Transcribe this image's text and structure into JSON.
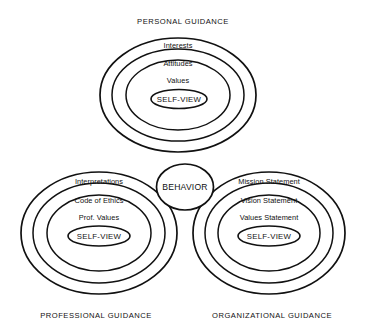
{
  "diagram": {
    "title_top": "PERSONAL GUIDANCE",
    "caption_left": "PROFESSIONAL  GUIDANCE",
    "caption_right": "ORGANIZATIONAL GUIDANCE",
    "center": {
      "label": "BEHAVIOR"
    },
    "colors": {
      "background": "#ffffff",
      "stroke": "#111111",
      "text": "#111111"
    },
    "groups": [
      {
        "id": "personal",
        "caption": "PERSONAL GUIDANCE",
        "caption_position": "top",
        "rings": [
          {
            "label": "Interests"
          },
          {
            "label": "Attitudes"
          },
          {
            "label": "Values"
          },
          {
            "label": "SELF-VIEW"
          }
        ]
      },
      {
        "id": "professional",
        "caption": "PROFESSIONAL  GUIDANCE",
        "caption_position": "bottom",
        "rings": [
          {
            "label": "Interpretations"
          },
          {
            "label": "Code of Ethics"
          },
          {
            "label": "Prof. Values"
          },
          {
            "label": "SELF-VIEW"
          }
        ]
      },
      {
        "id": "organizational",
        "caption": "ORGANIZATIONAL GUIDANCE",
        "caption_position": "bottom",
        "rings": [
          {
            "label": "Mission Statement"
          },
          {
            "label": "Vision Statement"
          },
          {
            "label": "Values Statement"
          },
          {
            "label": "SELF-VIEW"
          }
        ]
      }
    ]
  }
}
